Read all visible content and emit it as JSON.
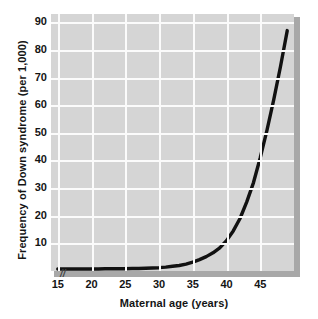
{
  "chart_data": {
    "type": "line",
    "title": "",
    "xlabel": "Maternal age (years)",
    "ylabel": "Frequency of Down syndrome (per 1,000)",
    "xlim": [
      14,
      50
    ],
    "ylim": [
      0,
      93
    ],
    "xticks": [
      15,
      20,
      25,
      30,
      35,
      40,
      45
    ],
    "xtick_labels": [
      "15",
      "20",
      "25",
      "30",
      "35",
      "40",
      "45"
    ],
    "yticks": [
      10,
      20,
      30,
      40,
      50,
      60,
      70,
      80,
      90
    ],
    "ytick_labels": [
      "10",
      "20",
      "30",
      "40",
      "50",
      "60",
      "70",
      "80",
      "90"
    ],
    "grid": true,
    "legend": null,
    "axis_break_symbol": "//",
    "series": [
      {
        "name": "Frequency of Down syndrome",
        "color": "#111111",
        "x": [
          15,
          16,
          17,
          18,
          19,
          20,
          21,
          22,
          23,
          24,
          25,
          26,
          27,
          28,
          29,
          30,
          31,
          32,
          33,
          34,
          35,
          36,
          37,
          38,
          39,
          40,
          41,
          42,
          43,
          44,
          45,
          46,
          47,
          48,
          49
        ],
        "y": [
          0.7,
          0.7,
          0.7,
          0.7,
          0.7,
          0.7,
          0.7,
          0.8,
          0.8,
          0.8,
          0.8,
          0.9,
          0.9,
          1.0,
          1.1,
          1.2,
          1.4,
          1.7,
          2.0,
          2.5,
          3.2,
          4.1,
          5.2,
          6.6,
          8.4,
          11.0,
          14.5,
          19.0,
          25.0,
          32.0,
          41.0,
          51.0,
          62.0,
          74.0,
          87.0
        ]
      }
    ],
    "plot_background": "#d5d5d5",
    "gridline_color": "#fbfbfb",
    "curve_color": "#111111",
    "text_color": "#141414"
  }
}
